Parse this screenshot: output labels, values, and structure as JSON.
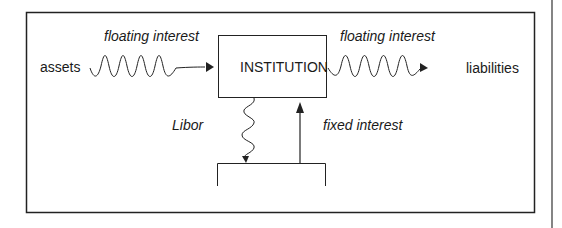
{
  "diagram": {
    "institution_label": "INSTITUTION",
    "left_label": "assets",
    "right_label": "liabilities",
    "left_flow_label": "floating interest",
    "right_flow_label": "floating interest",
    "down_flow_label": "Libor",
    "up_flow_label": "fixed interest"
  },
  "colors": {
    "stroke": "#1a1a1a",
    "background": "#ffffff"
  }
}
